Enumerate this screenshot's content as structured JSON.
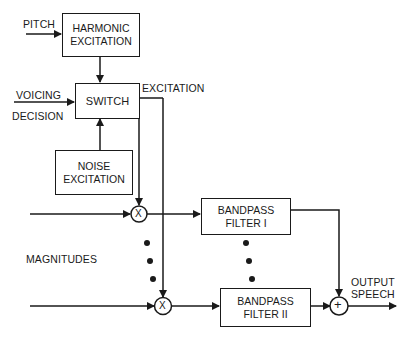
{
  "diagram": {
    "type": "block-diagram",
    "title": "",
    "blocks": {
      "harmonic": {
        "line1": "HARMONIC",
        "line2": "EXCITATION"
      },
      "switch": {
        "label": "SWITCH"
      },
      "noise": {
        "line1": "NOISE",
        "line2": "EXCITATION"
      },
      "bandpass1": {
        "line1": "BANDPASS",
        "line2": "FILTER I"
      },
      "bandpass2": {
        "line1": "BANDPASS",
        "line2": "FILTER II"
      }
    },
    "labels": {
      "pitch": "PITCH",
      "voicing": "VOICING",
      "decision": "DECISION",
      "excitation": "EXCITATION",
      "magnitudes": "MAGNITUDES",
      "output1": "OUTPUT",
      "output2": "SPEECH"
    },
    "operators": {
      "multiply": "X",
      "sum": "+"
    }
  }
}
